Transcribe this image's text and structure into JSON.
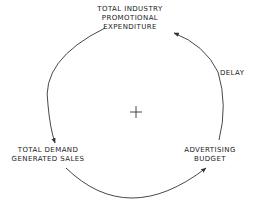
{
  "diagram": {
    "type": "causal-loop",
    "nodes": [
      {
        "id": "top",
        "lines": [
          "TOTAL INDUSTRY",
          "PROMOTIONAL",
          "EXPENDITURE"
        ]
      },
      {
        "id": "left",
        "lines": [
          "TOTAL DEMAND",
          "GENERATED SALES"
        ]
      },
      {
        "id": "right",
        "lines": [
          "ADVERTISING",
          "BUDGET"
        ]
      }
    ],
    "edges": [
      {
        "from": "top",
        "to": "left",
        "label": ""
      },
      {
        "from": "left",
        "to": "right",
        "label": ""
      },
      {
        "from": "right",
        "to": "top",
        "label": "DELAY"
      }
    ],
    "loop_polarity": "+",
    "colors": {
      "line": "#333333",
      "text": "#222222",
      "background": "#ffffff"
    }
  }
}
